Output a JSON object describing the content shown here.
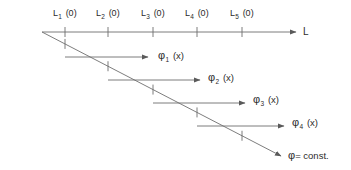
{
  "figure": {
    "type": "schematic-diagram",
    "background_color": "#ffffff",
    "line_color": "#6e6e6e",
    "text_color": "#2b2b2b",
    "width": 351,
    "height": 170
  },
  "axis": {
    "name": "L",
    "label_x": 303,
    "label_y": 27,
    "line": {
      "x1": 42,
      "y1": 32,
      "x2": 296,
      "y2": 32
    },
    "ticks": [
      {
        "x": 65,
        "label_main": "L",
        "label_sub": "1",
        "label_suffix": " (0)",
        "label_x": 53,
        "label_y": 9
      },
      {
        "x": 108,
        "label_main": "L",
        "label_sub": "2",
        "label_suffix": " (0)",
        "label_x": 96,
        "label_y": 9
      },
      {
        "x": 153,
        "label_main": "L",
        "label_sub": "3",
        "label_suffix": " (0)",
        "label_x": 141,
        "label_y": 9
      },
      {
        "x": 197,
        "label_main": "L",
        "label_sub": "4",
        "label_suffix": " (0)",
        "label_x": 185,
        "label_y": 9
      },
      {
        "x": 242,
        "label_main": "L",
        "label_sub": "5",
        "label_suffix": " (0)",
        "label_x": 230,
        "label_y": 9
      }
    ]
  },
  "diagonal": {
    "label_main": "φ",
    "label_suffix": "= const.",
    "label_x": 288,
    "label_y": 150,
    "line": {
      "x1": 42,
      "y1": 32,
      "x2": 281,
      "y2": 156
    },
    "tick_xs": [
      65,
      108,
      153,
      197,
      242
    ]
  },
  "phi_arrows": [
    {
      "name": "phi-1",
      "label_main": "φ",
      "label_sub": "1",
      "label_suffix": " (x)",
      "label_x": 158,
      "label_y": 50,
      "start_x": 65,
      "end_x": 148,
      "y": 57
    },
    {
      "name": "phi-2",
      "label_main": "φ",
      "label_sub": "2",
      "label_suffix": " (x)",
      "label_x": 208,
      "label_y": 72,
      "start_x": 108,
      "end_x": 200,
      "y": 80
    },
    {
      "name": "phi-3",
      "label_main": "φ",
      "label_sub": "3",
      "label_suffix": " (x)",
      "label_x": 253,
      "label_y": 94,
      "start_x": 153,
      "end_x": 245,
      "y": 103
    },
    {
      "name": "phi-4",
      "label_main": "φ",
      "label_sub": "4",
      "label_suffix": " (x)",
      "label_x": 292,
      "label_y": 117,
      "start_x": 197,
      "end_x": 284,
      "y": 126
    }
  ]
}
